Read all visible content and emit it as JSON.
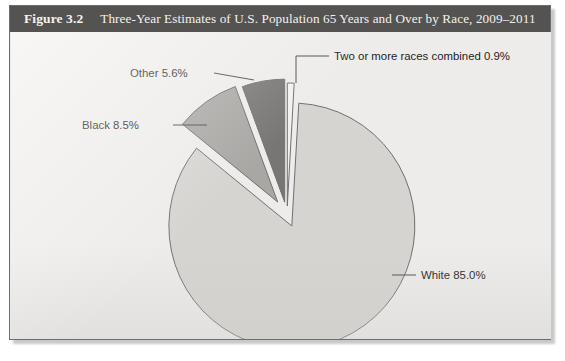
{
  "figure": {
    "number": "Figure 3.2",
    "caption": "Three-Year Estimates of U.S. Population 65 Years and Over by Race, 2009–2011"
  },
  "chart_data": {
    "type": "pie",
    "title": "Three-Year Estimates of U.S. Population 65 Years and Over by Race, 2009–2011",
    "xlabel": "",
    "ylabel": "",
    "unit": "percent",
    "legend_position": "none",
    "labels_inline": true,
    "exploded": true,
    "categories": [
      "White",
      "Black",
      "Other",
      "Two or more races combined"
    ],
    "values": [
      85.0,
      8.5,
      5.6,
      0.9
    ],
    "colors": [
      "#d6d4d1",
      "#a9a7a4",
      "#787674",
      "#f3f1ee"
    ],
    "slice_labels": [
      "White 85.0%",
      "Black 8.5%",
      "Other 5.6%",
      "Two or more races combined 0.9%"
    ]
  }
}
